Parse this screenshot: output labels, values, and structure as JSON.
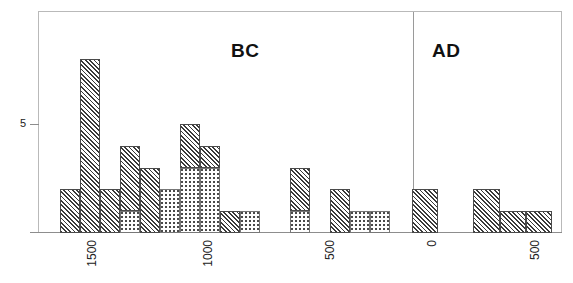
{
  "chart_data": {
    "type": "bar",
    "title": "",
    "subtitle": "",
    "xlabel": "",
    "ylabel": "",
    "grid": false,
    "legend_position": "none",
    "orientation": "vertical",
    "stacked": true,
    "bar_width_years": 50,
    "axis": {
      "x_tick_labels": [
        "1500",
        "1000",
        "500",
        "0",
        "500"
      ],
      "x_tick_positions_px": [
        80,
        196,
        318,
        420,
        523
      ],
      "x_tick_values": [
        -1500,
        -1000,
        -500,
        0,
        500
      ],
      "x_label_rotation_deg": 90,
      "y_tick_labels": [
        "5"
      ],
      "y_tick_values": [
        5
      ],
      "ylim": [
        0,
        9
      ],
      "xlim_years": [
        -1600,
        620
      ]
    },
    "annotations": [
      {
        "text": "BC",
        "x_px": 231,
        "y_px": 40
      },
      {
        "text": "AD",
        "x_px": 432,
        "y_px": 40
      }
    ],
    "divider": {
      "label": "0 / era boundary",
      "x_px": 413
    },
    "series": [
      {
        "name": "hatched",
        "pattern": "diagonal-hatch",
        "color": "#3a3a3a"
      },
      {
        "name": "dotted",
        "pattern": "fine-dots",
        "color": "#777777"
      }
    ],
    "bars": [
      {
        "x_px": 60,
        "width_px": 20,
        "hatched": 2,
        "dotted": 0,
        "total": 2
      },
      {
        "x_px": 80,
        "width_px": 20,
        "hatched": 8,
        "dotted": 0,
        "total": 8
      },
      {
        "x_px": 100,
        "width_px": 20,
        "hatched": 2,
        "dotted": 0,
        "total": 2
      },
      {
        "x_px": 120,
        "width_px": 20,
        "hatched": 3,
        "dotted": 1,
        "total": 4
      },
      {
        "x_px": 140,
        "width_px": 20,
        "hatched": 3,
        "dotted": 0,
        "total": 3
      },
      {
        "x_px": 160,
        "width_px": 20,
        "hatched": 0,
        "dotted": 2,
        "total": 2
      },
      {
        "x_px": 180,
        "width_px": 20,
        "hatched": 2,
        "dotted": 3,
        "total": 5
      },
      {
        "x_px": 200,
        "width_px": 20,
        "hatched": 1,
        "dotted": 3,
        "total": 4
      },
      {
        "x_px": 220,
        "width_px": 20,
        "hatched": 1,
        "dotted": 0,
        "total": 1
      },
      {
        "x_px": 240,
        "width_px": 20,
        "hatched": 0,
        "dotted": 1,
        "total": 1
      },
      {
        "x_px": 290,
        "width_px": 20,
        "hatched": 2,
        "dotted": 1,
        "total": 3
      },
      {
        "x_px": 330,
        "width_px": 20,
        "hatched": 2,
        "dotted": 0,
        "total": 2
      },
      {
        "x_px": 350,
        "width_px": 20,
        "hatched": 0,
        "dotted": 1,
        "total": 1
      },
      {
        "x_px": 370,
        "width_px": 20,
        "hatched": 0,
        "dotted": 1,
        "total": 1
      },
      {
        "x_px": 412,
        "width_px": 26,
        "hatched": 2,
        "dotted": 0,
        "total": 2
      },
      {
        "x_px": 473,
        "width_px": 27,
        "hatched": 2,
        "dotted": 0,
        "total": 2
      },
      {
        "x_px": 500,
        "width_px": 26,
        "hatched": 1,
        "dotted": 0,
        "total": 1
      },
      {
        "x_px": 526,
        "width_px": 26,
        "hatched": 1,
        "dotted": 0,
        "total": 1
      }
    ]
  },
  "labels": {
    "era_bc": "BC",
    "era_ad": "AD",
    "y_tick_5": "5"
  }
}
